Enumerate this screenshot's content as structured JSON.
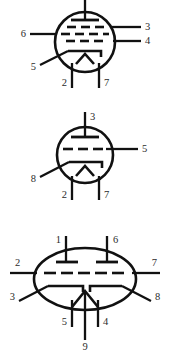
{
  "figure": {
    "background_color": "#ffffff",
    "line_color": "#111111",
    "label_color": "#2b2b2b"
  },
  "tubes": [
    {
      "id": "tube-1",
      "type": "pentode",
      "envelope": "circle",
      "pins": [
        {
          "number": "",
          "name": "pin-top-unlabeled",
          "side": "top"
        },
        {
          "number": "3",
          "name": "pin-3",
          "side": "right"
        },
        {
          "number": "4",
          "name": "pin-4",
          "side": "right"
        },
        {
          "number": "6",
          "name": "pin-6",
          "side": "left"
        },
        {
          "number": "5",
          "name": "pin-5",
          "side": "left-diagonal"
        },
        {
          "number": "2",
          "name": "pin-2",
          "side": "bottom"
        },
        {
          "number": "7",
          "name": "pin-7",
          "side": "bottom"
        }
      ]
    },
    {
      "id": "tube-2",
      "type": "triode",
      "envelope": "circle",
      "pins": [
        {
          "number": "3",
          "name": "pin-3",
          "side": "top"
        },
        {
          "number": "5",
          "name": "pin-5",
          "side": "right"
        },
        {
          "number": "8",
          "name": "pin-8",
          "side": "left-diagonal"
        },
        {
          "number": "2",
          "name": "pin-2",
          "side": "bottom"
        },
        {
          "number": "7",
          "name": "pin-7",
          "side": "bottom"
        }
      ]
    },
    {
      "id": "tube-3",
      "type": "dual-triode",
      "envelope": "oval",
      "pins": [
        {
          "number": "1",
          "name": "pin-1",
          "side": "top"
        },
        {
          "number": "6",
          "name": "pin-6",
          "side": "top"
        },
        {
          "number": "2",
          "name": "pin-2",
          "side": "left"
        },
        {
          "number": "7",
          "name": "pin-7",
          "side": "right"
        },
        {
          "number": "3",
          "name": "pin-3",
          "side": "left-diagonal"
        },
        {
          "number": "8",
          "name": "pin-8",
          "side": "right-diagonal"
        },
        {
          "number": "5",
          "name": "pin-5",
          "side": "bottom"
        },
        {
          "number": "9",
          "name": "pin-9",
          "side": "bottom"
        },
        {
          "number": "4",
          "name": "pin-4",
          "side": "bottom"
        }
      ]
    }
  ],
  "labels": {
    "t1_p3": "3",
    "t1_p4": "4",
    "t1_p6": "6",
    "t1_p5": "5",
    "t1_p2": "2",
    "t1_p7": "7",
    "t2_p3": "3",
    "t2_p5": "5",
    "t2_p8": "8",
    "t2_p2": "2",
    "t2_p7": "7",
    "t3_p1": "1",
    "t3_p6": "6",
    "t3_p2": "2",
    "t3_p7": "7",
    "t3_p3": "3",
    "t3_p8": "8",
    "t3_p5": "5",
    "t3_p9": "9",
    "t3_p4": "4"
  }
}
